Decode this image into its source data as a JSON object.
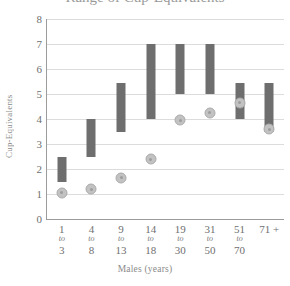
{
  "chart_data": {
    "type": "bar",
    "title": "Range of Cup-Equivalents",
    "xlabel": "Males (years)",
    "ylabel": "Cup-Equivalents",
    "ylim": [
      0,
      8
    ],
    "yticks": [
      0,
      1,
      2,
      3,
      4,
      5,
      6,
      7,
      8
    ],
    "grid": true,
    "legend": "none",
    "categories": [
      "1 to 3",
      "4 to 8",
      "9 to 13",
      "14 to 18",
      "19 to 30",
      "31 to 50",
      "51 to 70",
      "71 +"
    ],
    "category_parts": [
      {
        "from": "1",
        "to": "to",
        "upper": "3"
      },
      {
        "from": "4",
        "to": "to",
        "upper": "8"
      },
      {
        "from": "9",
        "to": "to",
        "upper": "13"
      },
      {
        "from": "14",
        "to": "to",
        "upper": "18"
      },
      {
        "from": "19",
        "to": "to",
        "upper": "30"
      },
      {
        "from": "31",
        "to": "to",
        "upper": "50"
      },
      {
        "from": "51",
        "to": "to",
        "upper": "70"
      },
      {
        "from": "71 +",
        "to": "",
        "upper": ""
      }
    ],
    "series": [
      {
        "name": "Recommended range",
        "type": "range-bar",
        "color": "#6e6e6e",
        "low": [
          1.5,
          2.5,
          3.5,
          4.0,
          5.0,
          5.0,
          4.0,
          3.5
        ],
        "high": [
          2.5,
          4.0,
          5.45,
          7.0,
          7.0,
          7.0,
          5.45,
          5.45
        ]
      },
      {
        "name": "Average intake",
        "type": "marker",
        "color": "#c2c2c2",
        "values": [
          1.05,
          1.2,
          1.65,
          2.4,
          3.95,
          4.25,
          4.65,
          3.6
        ]
      }
    ]
  },
  "colors": {
    "bar": "#6e6e6e",
    "dot": "#c2c2c2",
    "dot_border": "#ababab",
    "grid": "#dcdcdc",
    "axis": "#9c9c9c",
    "text": "#6f6f6f"
  }
}
